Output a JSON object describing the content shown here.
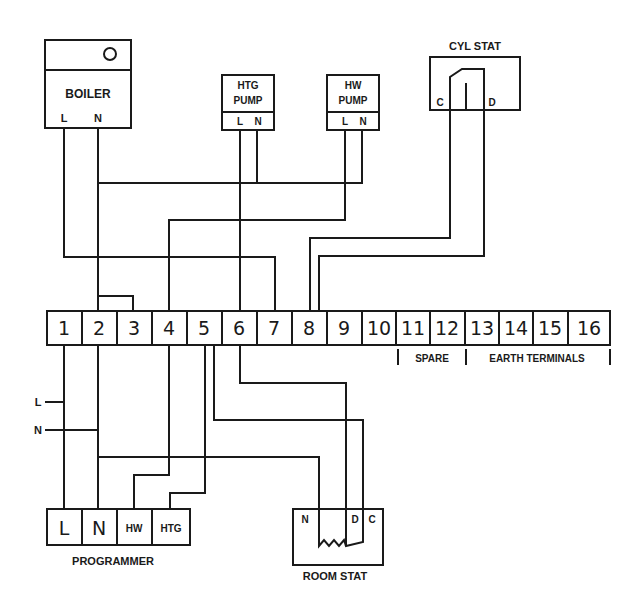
{
  "diagram": {
    "type": "wiring-diagram",
    "components": {
      "boiler": {
        "label": "BOILER",
        "terminals": [
          "L",
          "N"
        ]
      },
      "htg_pump": {
        "label_line1": "HTG",
        "label_line2": "PUMP",
        "terminals": [
          "L",
          "N"
        ]
      },
      "hw_pump": {
        "label_line1": "HW",
        "label_line2": "PUMP",
        "terminals": [
          "L",
          "N"
        ]
      },
      "cyl_stat": {
        "label": "CYL STAT",
        "terminals": [
          "C",
          "D"
        ]
      },
      "programmer": {
        "label": "PROGRAMMER",
        "terminals": [
          "L",
          "N",
          "HW",
          "HTG"
        ]
      },
      "room_stat": {
        "label": "ROOM STAT",
        "terminals": [
          "N",
          "D",
          "C"
        ]
      }
    },
    "terminal_strip": {
      "numbers": [
        "1",
        "2",
        "3",
        "4",
        "5",
        "6",
        "7",
        "8",
        "9",
        "10",
        "11",
        "12",
        "13",
        "14",
        "15",
        "16"
      ],
      "group_labels": {
        "spare": "SPARE",
        "earth": "EARTH TERMINALS"
      }
    },
    "supply": {
      "live": "L",
      "neutral": "N"
    }
  }
}
